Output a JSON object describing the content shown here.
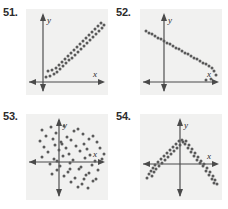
{
  "page": {
    "background_color": "#ffffff",
    "panel_color": "#f1f1f0",
    "axis_color": "#4a4a4a",
    "dot_color": "#5a5a5a",
    "width": 228,
    "height": 209
  },
  "exercises": [
    {
      "label": "51.",
      "label_x": 3,
      "label_y": 6,
      "panel": {
        "x": 26,
        "y": 9,
        "w": 82,
        "h": 86
      },
      "axes": {
        "x_label": "x",
        "y_label": "y",
        "origin_x": 17,
        "origin_y": 73,
        "x_axis_y": 73,
        "y_axis_x": 17
      },
      "chart_data": {
        "type": "scatter",
        "title": "51.",
        "xlabel": "x",
        "ylabel": "y",
        "correlation": "positive linear",
        "grid": false,
        "legend": "none",
        "points": [
          [
            20,
            68
          ],
          [
            24,
            67
          ],
          [
            28,
            65
          ],
          [
            22,
            62
          ],
          [
            26,
            61
          ],
          [
            31,
            63
          ],
          [
            30,
            59
          ],
          [
            34,
            60
          ],
          [
            33,
            56
          ],
          [
            37,
            57
          ],
          [
            36,
            53
          ],
          [
            40,
            54
          ],
          [
            39,
            50
          ],
          [
            43,
            51
          ],
          [
            42,
            47
          ],
          [
            46,
            49
          ],
          [
            45,
            44
          ],
          [
            49,
            46
          ],
          [
            48,
            41
          ],
          [
            52,
            43
          ],
          [
            51,
            38
          ],
          [
            55,
            40
          ],
          [
            54,
            35
          ],
          [
            58,
            37
          ],
          [
            57,
            32
          ],
          [
            61,
            34
          ],
          [
            60,
            29
          ],
          [
            64,
            31
          ],
          [
            63,
            26
          ],
          [
            67,
            28
          ],
          [
            66,
            23
          ],
          [
            70,
            25
          ],
          [
            69,
            20
          ],
          [
            73,
            22
          ],
          [
            72,
            17
          ],
          [
            76,
            19
          ],
          [
            75,
            14
          ],
          [
            78,
            16
          ]
        ]
      }
    },
    {
      "label": "52.",
      "label_x": 116,
      "label_y": 6,
      "panel": {
        "x": 140,
        "y": 9,
        "w": 82,
        "h": 86
      },
      "axes": {
        "x_label": "x",
        "y_label": "y",
        "origin_x": 24,
        "origin_y": 73,
        "x_axis_y": 73,
        "y_axis_x": 24
      },
      "chart_data": {
        "type": "scatter",
        "title": "52.",
        "xlabel": "x",
        "ylabel": "y",
        "correlation": "negative linear",
        "grid": false,
        "legend": "none",
        "points": [
          [
            6,
            22
          ],
          [
            9,
            24
          ],
          [
            12,
            25
          ],
          [
            15,
            27
          ],
          [
            18,
            29
          ],
          [
            21,
            30
          ],
          [
            24,
            32
          ],
          [
            27,
            34
          ],
          [
            30,
            35
          ],
          [
            33,
            37
          ],
          [
            36,
            39
          ],
          [
            39,
            40
          ],
          [
            42,
            42
          ],
          [
            45,
            44
          ],
          [
            48,
            45
          ],
          [
            51,
            47
          ],
          [
            54,
            49
          ],
          [
            57,
            50
          ],
          [
            60,
            52
          ],
          [
            63,
            54
          ],
          [
            66,
            55
          ],
          [
            69,
            57
          ],
          [
            72,
            59
          ],
          [
            74,
            62
          ],
          [
            76,
            66
          ],
          [
            71,
            70
          ],
          [
            66,
            71
          ]
        ]
      }
    },
    {
      "label": "53.",
      "label_x": 3,
      "label_y": 110,
      "panel": {
        "x": 26,
        "y": 114,
        "w": 82,
        "h": 86
      },
      "axes": {
        "x_label": "x",
        "y_label": "y",
        "origin_x": 33,
        "origin_y": 48,
        "x_axis_y": 48,
        "y_axis_x": 33
      },
      "chart_data": {
        "type": "scatter",
        "title": "53.",
        "xlabel": "x",
        "ylabel": "y",
        "correlation": "no correlation",
        "grid": false,
        "legend": "none",
        "points": [
          [
            16,
            16
          ],
          [
            25,
            13
          ],
          [
            38,
            12
          ],
          [
            48,
            17
          ],
          [
            57,
            20
          ],
          [
            20,
            22
          ],
          [
            30,
            19
          ],
          [
            41,
            23
          ],
          [
            52,
            15
          ],
          [
            63,
            25
          ],
          [
            14,
            27
          ],
          [
            27,
            25
          ],
          [
            35,
            28
          ],
          [
            45,
            26
          ],
          [
            58,
            30
          ],
          [
            67,
            22
          ],
          [
            18,
            33
          ],
          [
            29,
            31
          ],
          [
            40,
            34
          ],
          [
            50,
            32
          ],
          [
            61,
            35
          ],
          [
            71,
            28
          ],
          [
            22,
            38
          ],
          [
            33,
            36
          ],
          [
            43,
            40
          ],
          [
            54,
            37
          ],
          [
            64,
            41
          ],
          [
            74,
            34
          ],
          [
            16,
            43
          ],
          [
            28,
            45
          ],
          [
            37,
            42
          ],
          [
            47,
            46
          ],
          [
            59,
            44
          ],
          [
            69,
            47
          ],
          [
            78,
            40
          ],
          [
            24,
            50
          ],
          [
            34,
            52
          ],
          [
            44,
            49
          ],
          [
            55,
            53
          ],
          [
            66,
            51
          ],
          [
            76,
            45
          ],
          [
            31,
            56
          ],
          [
            42,
            58
          ],
          [
            53,
            55
          ],
          [
            63,
            59
          ],
          [
            72,
            56
          ],
          [
            38,
            62
          ],
          [
            49,
            64
          ],
          [
            60,
            61
          ],
          [
            70,
            65
          ],
          [
            45,
            68
          ],
          [
            56,
            70
          ],
          [
            67,
            67
          ],
          [
            52,
            73
          ],
          [
            62,
            74
          ],
          [
            36,
            30
          ],
          [
            26,
            60
          ],
          [
            58,
            65
          ],
          [
            44,
            55
          ],
          [
            31,
            47
          ]
        ]
      }
    },
    {
      "label": "54.",
      "label_x": 116,
      "label_y": 110,
      "panel": {
        "x": 140,
        "y": 114,
        "w": 82,
        "h": 86
      },
      "axes": {
        "x_label": "x",
        "y_label": "y",
        "origin_x": 40,
        "origin_y": 50,
        "x_axis_y": 50,
        "y_axis_x": 40
      },
      "chart_data": {
        "type": "scatter",
        "title": "54.",
        "xlabel": "x",
        "ylabel": "y",
        "correlation": "nonlinear (parabolic / inverted U)",
        "grid": false,
        "legend": "none",
        "points": [
          [
            7,
            64
          ],
          [
            9,
            60
          ],
          [
            12,
            62
          ],
          [
            11,
            57
          ],
          [
            14,
            58
          ],
          [
            13,
            54
          ],
          [
            16,
            55
          ],
          [
            15,
            51
          ],
          [
            19,
            52
          ],
          [
            18,
            48
          ],
          [
            22,
            49
          ],
          [
            21,
            45
          ],
          [
            25,
            46
          ],
          [
            24,
            42
          ],
          [
            28,
            43
          ],
          [
            27,
            39
          ],
          [
            31,
            40
          ],
          [
            30,
            36
          ],
          [
            34,
            37
          ],
          [
            33,
            33
          ],
          [
            37,
            34
          ],
          [
            36,
            30
          ],
          [
            40,
            31
          ],
          [
            39,
            27
          ],
          [
            43,
            28
          ],
          [
            42,
            26
          ],
          [
            46,
            27
          ],
          [
            45,
            30
          ],
          [
            49,
            31
          ],
          [
            48,
            34
          ],
          [
            52,
            35
          ],
          [
            51,
            38
          ],
          [
            55,
            39
          ],
          [
            54,
            42
          ],
          [
            58,
            43
          ],
          [
            57,
            46
          ],
          [
            61,
            47
          ],
          [
            60,
            49
          ],
          [
            64,
            50
          ],
          [
            63,
            52
          ],
          [
            67,
            54
          ],
          [
            66,
            57
          ],
          [
            70,
            58
          ],
          [
            69,
            61
          ],
          [
            73,
            62
          ],
          [
            72,
            65
          ],
          [
            75,
            66
          ],
          [
            74,
            69
          ],
          [
            77,
            70
          ]
        ]
      }
    }
  ]
}
